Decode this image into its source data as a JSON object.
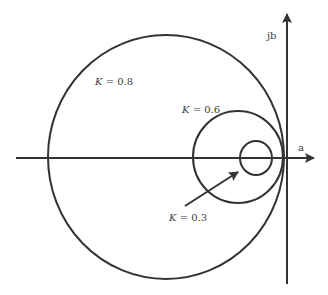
{
  "diagram": {
    "type": "circle-locus-diagram",
    "colors": {
      "stroke": "#333333",
      "background": "#ffffff"
    },
    "axes": {
      "horizontal": {
        "label": "a",
        "from": [
          16,
          158
        ],
        "to": [
          316,
          158
        ]
      },
      "vertical": {
        "label": "jb",
        "from": [
          287,
          284
        ],
        "to": [
          287,
          12
        ]
      }
    },
    "circles": [
      {
        "k_label": "K = 0.8",
        "k_var": "K",
        "k_value": "0.8",
        "cx": 166,
        "cy": 157,
        "rx": 118,
        "ry": 122,
        "label_pos": [
          95,
          85
        ]
      },
      {
        "k_label": "K = 0.6",
        "k_var": "K",
        "k_value": "0.6",
        "cx": 238,
        "cy": 157,
        "rx": 45,
        "ry": 46,
        "label_pos": [
          182,
          113
        ]
      },
      {
        "k_label": "K = 0.3",
        "k_var": "K",
        "k_value": "0.3",
        "cx": 256,
        "cy": 158,
        "rx": 16,
        "ry": 17,
        "label_pos": [
          169,
          221
        ]
      }
    ],
    "pointer_arrow": {
      "from": [
        185,
        206
      ],
      "to": [
        240,
        171
      ],
      "points_to": "K = 0.3 circle"
    }
  }
}
